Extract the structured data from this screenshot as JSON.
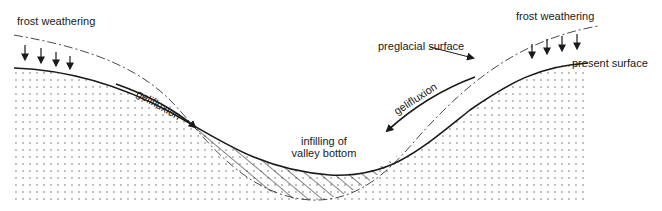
{
  "diagram": {
    "type": "valley cross-section (periglacial processes)",
    "labels": {
      "frost_weathering_left": "frost weathering",
      "frost_weathering_right": "frost weathering",
      "preglacial_surface": "preglacial surface",
      "present_surface": "present surface",
      "gelifluxion_left": "gelifluxion",
      "gelifluxion_right": "gelifluxion",
      "infill_line1": "infilling of",
      "infill_line2": "valley bottom"
    },
    "legend_semantics": {
      "solid_line": "present surface",
      "dashed_line": "preglacial surface",
      "dotted_fill": "bedrock",
      "hatched_fill": "infilling of valley bottom",
      "down_arrows": "frost weathering",
      "slope_arrows": "gelifluxion"
    },
    "colors": {
      "ink": "#1a1a1a",
      "background": "#ffffff",
      "dots": "#555555"
    }
  }
}
